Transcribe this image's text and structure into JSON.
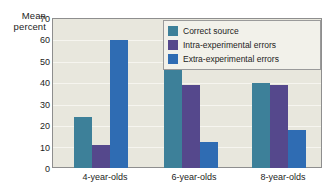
{
  "chart_data": {
    "type": "bar",
    "title": "",
    "subtitle": "",
    "xlabel": "",
    "ylabel": "Mean percent",
    "ylabel_line1": "Mean",
    "ylabel_line2": "percent",
    "ylim": [
      0,
      70
    ],
    "ytick_step": 10,
    "yticks": [
      70,
      60,
      50,
      40,
      30,
      20,
      10,
      0
    ],
    "categories": [
      "4-year-olds",
      "6-year-olds",
      "8-year-olds"
    ],
    "grid": "horizontal",
    "legend_position": "top-right",
    "series": [
      {
        "name": "Correct source",
        "color": "#3d8099",
        "values": [
          24,
          47,
          40
        ]
      },
      {
        "name": "Intra-experimental errors",
        "color": "#55488c",
        "values": [
          11,
          39,
          39
        ]
      },
      {
        "name": "Extra-experimental errors",
        "color": "#2f6cb3",
        "values": [
          60,
          12,
          18
        ]
      }
    ]
  },
  "colors": {
    "plot_background": "#e8e7dd",
    "page_background": "#ffffff",
    "gridline": "#f6f5ef",
    "axis_line": "#8e8e8e",
    "legend_background": "#f2f1ea",
    "legend_border": "#9a9a9a",
    "text": "#1d1d1d"
  }
}
